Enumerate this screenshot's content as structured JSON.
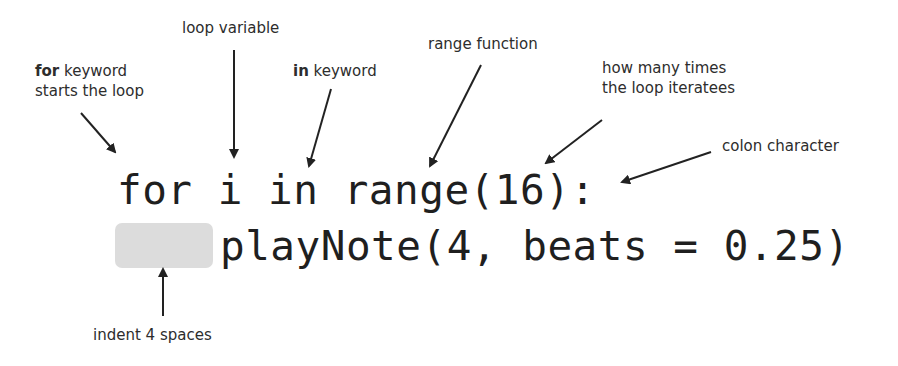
{
  "annotations": {
    "for_keyword": {
      "bold": "for",
      "rest": " keyword",
      "line2": "starts the loop"
    },
    "loop_variable": "loop variable",
    "in_keyword": {
      "bold": "in",
      "rest": " keyword"
    },
    "range_function": "range function",
    "iterations": {
      "line1": "how many times",
      "line2": "the loop iteratees"
    },
    "colon": "colon character",
    "indent": "indent 4 spaces"
  },
  "code": {
    "line1": "for i in range(16):",
    "line2": "playNote(4, beats = 0.25)"
  },
  "colors": {
    "text": "#2d2d2d",
    "code": "#1f1f1f",
    "indent_highlight": "#dcdcdc",
    "arrow": "#222222"
  }
}
